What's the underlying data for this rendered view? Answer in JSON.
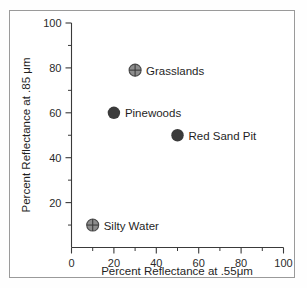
{
  "chart_data": {
    "type": "scatter",
    "title": "",
    "xlabel": "Percent Reflectance at .55μm",
    "ylabel": "Percent Reflectance at .85 μm",
    "xlim": [
      0,
      100
    ],
    "ylim": [
      0,
      100
    ],
    "grid": false,
    "legend": "none",
    "x_ticks": [
      "0",
      "20",
      "40",
      "60",
      "80",
      "100"
    ],
    "x_tick_values": [
      0,
      20,
      40,
      60,
      80,
      100
    ],
    "x_minor_tick_values": [
      10,
      30,
      50,
      70,
      90
    ],
    "y_ticks": [
      "20",
      "40",
      "60",
      "80",
      "100"
    ],
    "y_tick_values": [
      20,
      40,
      60,
      80,
      100
    ],
    "y_minor_tick_values": [
      10,
      30,
      50,
      70,
      90
    ],
    "points": [
      {
        "label": "Grasslands",
        "x": 30,
        "y": 79,
        "marker": "crosshair-circle",
        "color": "#8d8d8d"
      },
      {
        "label": "Pinewoods",
        "x": 20,
        "y": 60,
        "marker": "filled-circle",
        "color": "#3b3b3b"
      },
      {
        "label": "Red Sand Pit",
        "x": 50,
        "y": 50,
        "marker": "filled-circle",
        "color": "#3b3b3b"
      },
      {
        "label": "Silty Water",
        "x": 10,
        "y": 10,
        "marker": "crosshair-circle",
        "color": "#8d8d8d"
      }
    ]
  },
  "figure": {
    "axis_color": "#3a3a3a",
    "border_color": "#9a9a9a",
    "background": "#ffffff"
  }
}
